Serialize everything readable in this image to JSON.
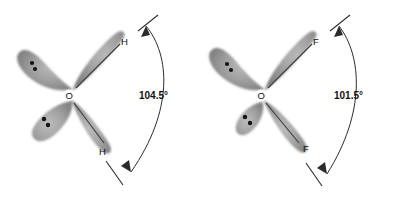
{
  "figure": {
    "name": "orbital-geometry-comparison",
    "background_color": "#ffffff",
    "ink_color": "#2b2b2b",
    "lobe_fill_color": "#9a9a9a",
    "lobe_edge_color": "#6e6e6e",
    "dot_color": "#1a1a1a",
    "label_color": "#111111"
  },
  "molecules": [
    {
      "id": "water",
      "center_atom": "O",
      "terminal_atom_top": "H",
      "terminal_atom_bottom": "H",
      "angle_label": "104.5°",
      "lone_pairs": 2,
      "dots_per_lone_pair": 2,
      "bonding_lobes": 2
    },
    {
      "id": "oxygen-difluoride",
      "center_atom": "O",
      "terminal_atom_top": "F",
      "terminal_atom_bottom": "F",
      "angle_label": "101.5°",
      "lone_pairs": 2,
      "dots_per_lone_pair": 2,
      "bonding_lobes": 2
    }
  ]
}
